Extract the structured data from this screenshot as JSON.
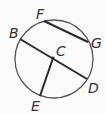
{
  "diagram": {
    "type": "circle-geometry",
    "circle": {
      "cx": 54,
      "cy": 59,
      "r": 39,
      "stroke": "#555555"
    },
    "points": {
      "B": {
        "label": "B",
        "x": 20,
        "y": 39
      },
      "C": {
        "label": "C",
        "x": 53,
        "y": 58
      },
      "D": {
        "label": "D",
        "x": 87,
        "y": 79
      },
      "E": {
        "label": "E",
        "x": 40,
        "y": 96
      },
      "F": {
        "label": "F",
        "x": 44,
        "y": 21
      },
      "G": {
        "label": "G",
        "x": 88,
        "y": 42
      }
    },
    "segments": [
      {
        "name": "chord-FG",
        "from": "F",
        "to": "G"
      },
      {
        "name": "diameter-BD",
        "from": "B",
        "to": "D"
      },
      {
        "name": "radius-CE",
        "from": "C",
        "to": "E"
      }
    ],
    "line_color": "#2a2a2a"
  }
}
